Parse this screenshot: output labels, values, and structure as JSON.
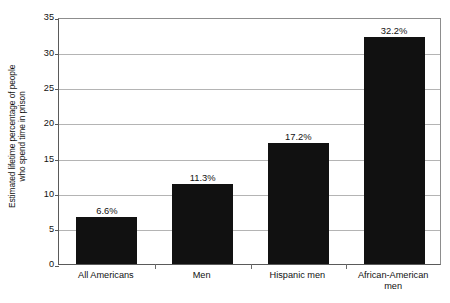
{
  "chart_data": {
    "type": "bar",
    "title": "",
    "xlabel": "",
    "ylabel_line1": "Estimated lifetime percentage of people",
    "ylabel_line2": "who spend time in prison",
    "categories": [
      "All Americans",
      "Men",
      "Hispanic men",
      "African-American men"
    ],
    "category_lines": [
      [
        "All Americans"
      ],
      [
        "Men"
      ],
      [
        "Hispanic men"
      ],
      [
        "African-American",
        "men"
      ]
    ],
    "values": [
      6.6,
      11.3,
      17.2,
      32.2
    ],
    "value_labels": [
      "6.6%",
      "11.3%",
      "17.2%",
      "32.2%"
    ],
    "ylim": [
      0,
      35
    ],
    "ytick_values": [
      0,
      5,
      10,
      15,
      20,
      25,
      30,
      35
    ],
    "ytick_labels": [
      "0",
      "5",
      "10",
      "15",
      "20",
      "25",
      "30",
      "35"
    ],
    "grid": true,
    "legend": "none",
    "bar_color": "#111111",
    "grid_color": "#b4b4b4",
    "axis_color": "#5a5a5a",
    "background_color": "#ffffff"
  }
}
